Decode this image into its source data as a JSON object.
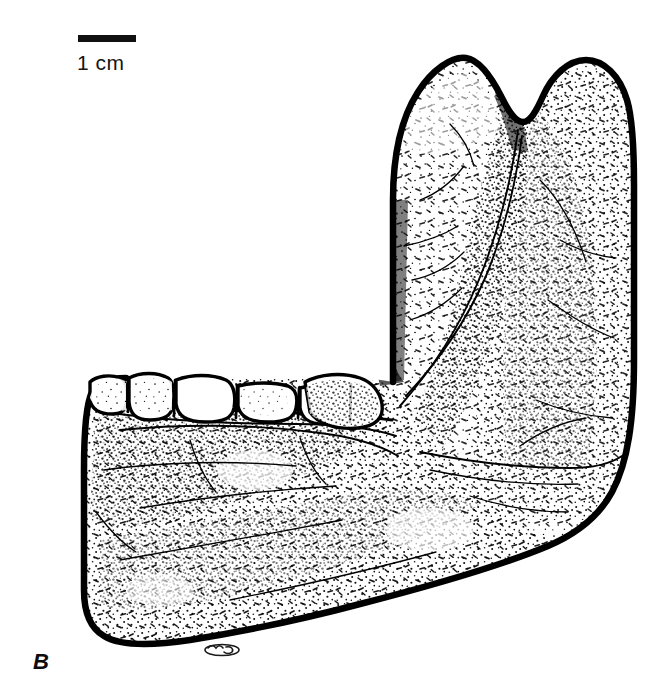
{
  "figure": {
    "panel_letter": "B",
    "view": "right lateral",
    "ink_color": "#000000",
    "background_color": "#ffffff"
  },
  "scale": {
    "label": "1 cm",
    "bar_length_px": 58,
    "bar_thickness_px": 7,
    "bar_color": "#111111"
  },
  "anatomy": {
    "regions": [
      {
        "name": "coronoid-process",
        "label": "coronoid process"
      },
      {
        "name": "condylar-process",
        "label": "condylar process"
      },
      {
        "name": "mandibular-notch",
        "label": "mandibular notch"
      },
      {
        "name": "ramus",
        "label": "ramus"
      },
      {
        "name": "gonial-angle",
        "label": "gonial angle"
      },
      {
        "name": "corpus",
        "label": "mandibular corpus"
      },
      {
        "name": "symphysis",
        "label": "symphyseal region"
      },
      {
        "name": "alveolar-margin",
        "label": "alveolar margin"
      },
      {
        "name": "inferior-border",
        "label": "inferior border"
      }
    ],
    "tooth_row": {
      "count": 6,
      "teeth": [
        "P3",
        "P4",
        "M1",
        "M2",
        "M3",
        "M3-distal"
      ]
    }
  },
  "artist_mark": {
    "name": "illustrator monogram",
    "present": true
  }
}
